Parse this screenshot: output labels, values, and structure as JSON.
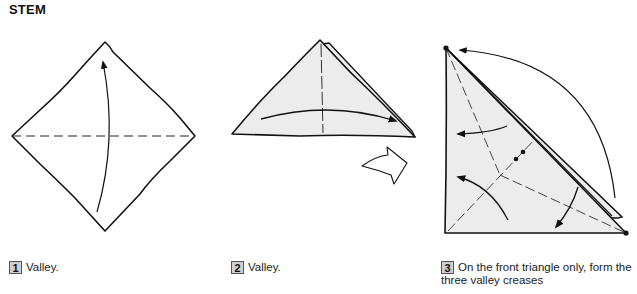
{
  "page": {
    "section_title": "STEM"
  },
  "colors": {
    "paper_fill": "#ececec",
    "line": "#111111",
    "step_badge_bg": "#cfcfcf"
  },
  "steps": [
    {
      "number": "1",
      "caption": "Valley.",
      "diagram": "square-diamond-valley-fold-up"
    },
    {
      "number": "2",
      "caption": "Valley.",
      "diagram": "triangle-valley-fold-right-then-turn-over"
    },
    {
      "number": "3",
      "caption": "On the front triangle only, form the three valley creases",
      "diagram": "right-triangle-three-valley-creases"
    }
  ],
  "symbols": {
    "fold_arrow": "curved-arrow",
    "turn_over": "turn-over-arrow",
    "valley_line": "dashed-line"
  }
}
